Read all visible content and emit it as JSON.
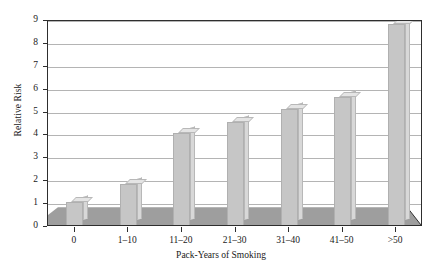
{
  "chart_data": {
    "type": "bar",
    "title": "",
    "subtitle": "",
    "xlabel": "Pack-Years of Smoking",
    "ylabel": "Relative Risk",
    "categories": [
      "0",
      "1–10",
      "11–20",
      "21–30",
      "31–40",
      "41–50",
      ">50"
    ],
    "values": [
      1.0,
      1.8,
      4.0,
      4.5,
      5.05,
      5.6,
      8.8
    ],
    "series": [
      {
        "name": "Relative Risk",
        "values": [
          1.0,
          1.8,
          4.0,
          4.5,
          5.05,
          5.6,
          8.8
        ]
      }
    ],
    "ylim": [
      0,
      9
    ],
    "xlim": [
      0,
      7
    ],
    "ytick_labels": [
      "0",
      "1",
      "2",
      "3",
      "4",
      "5",
      "6",
      "7",
      "8",
      "9"
    ],
    "ytick_values": [
      0,
      1,
      2,
      3,
      4,
      5,
      6,
      7,
      8,
      9
    ],
    "grid": true,
    "grid_axis": "y",
    "legend": false,
    "legend_position": "none",
    "annotations": [],
    "style": "pseudo-3d",
    "colors": {
      "bar_front": "#c6c6c6",
      "bar_side": "#d8d8d8",
      "bar_top": "#e4e4e4",
      "bar_edge": "#b0b0b0",
      "floor": "#9e9e9e",
      "gridline": "#b4b4b4",
      "axis": "#2e2e2e",
      "text": "#1a1a1a",
      "background": "#ffffff"
    }
  },
  "axes": {
    "y_title": "Relative Risk",
    "x_title": "Pack-Years of Smoking"
  }
}
